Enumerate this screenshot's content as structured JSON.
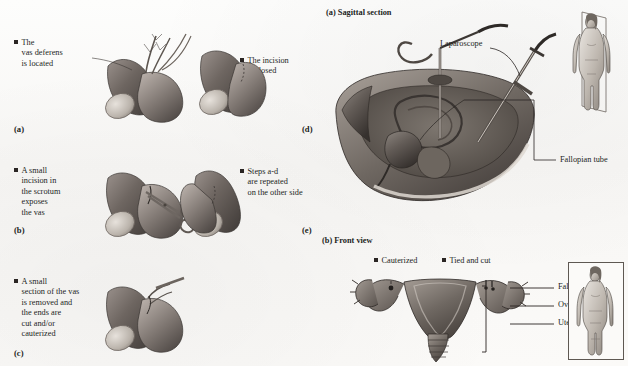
{
  "figure": {
    "background_color": "#fbfaf8",
    "ink_color": "#241f1d"
  },
  "left_panel": {
    "title_implicit": "Vasectomy procedure steps",
    "steps": [
      {
        "id": "(a)",
        "bullet": "square",
        "lines": [
          "The",
          "vas deferens",
          "is located"
        ],
        "illustration": "scrotum-vas-located"
      },
      {
        "id": "(b)",
        "bullet": "square",
        "lines": [
          "A small",
          "incision in",
          "the scrotum",
          "exposes",
          "the vas"
        ],
        "illustration": "scrotum-incision-scissors"
      },
      {
        "id": "(c)",
        "bullet": "square",
        "lines": [
          "A small",
          "section of the vas",
          "is removed and",
          "the ends are",
          "cut and/or",
          "cauterized"
        ],
        "illustration": "scrotum-vas-removed"
      },
      {
        "id": "(d)",
        "bullet": "square",
        "lines": [
          "The incision",
          "is closed"
        ],
        "illustration": "scrotum-closed"
      },
      {
        "id": "(e)",
        "bullet": "square",
        "lines": [
          "Steps a-d",
          "are repeated",
          "on the other side"
        ],
        "illustration": "scrotum-other-side"
      }
    ]
  },
  "right_panel": {
    "views": [
      {
        "id": "(a)",
        "label": "Sagittal section",
        "annotations": [
          {
            "text": "Laparoscope",
            "target": "laparoscope-instrument"
          },
          {
            "text": "Fallopian tube",
            "target": "fallopian-tube-sagittal"
          }
        ],
        "inset": "female-body-sagittal-plane-inset"
      },
      {
        "id": "(b)",
        "label": "Front view",
        "bullet_labels": [
          {
            "text": "Cauterized",
            "bullet": "square"
          },
          {
            "text": "Tied and cut",
            "bullet": "square"
          }
        ],
        "annotations": [
          {
            "text": "Fallopian tube",
            "target": "fallopian-tube-front"
          },
          {
            "text": "Ovary",
            "target": "ovary-front"
          },
          {
            "text": "Uterus",
            "target": "uterus-front"
          }
        ],
        "inset": "female-body-front-inset"
      }
    ]
  }
}
